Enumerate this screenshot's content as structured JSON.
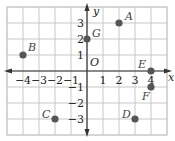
{
  "diagram": {
    "type": "coordinate-plane",
    "x_axis_label": "x",
    "y_axis_label": "y",
    "origin_label": "O",
    "x_range": [
      -4,
      4
    ],
    "y_range": [
      -3,
      3
    ],
    "x_ticks": [
      "-4",
      "-3",
      "-2",
      "-1",
      "1",
      "2",
      "3",
      "4"
    ],
    "y_ticks": [
      "3",
      "2",
      "1",
      "-1",
      "-2",
      "-3"
    ],
    "grid_color": "#c8c8c8",
    "axis_color": "#333333",
    "point_color": "#555555",
    "points": [
      {
        "label": "A",
        "x": 2,
        "y": 3
      },
      {
        "label": "B",
        "x": -4,
        "y": 1
      },
      {
        "label": "C",
        "x": -2,
        "y": -3
      },
      {
        "label": "D",
        "x": 3,
        "y": -3
      },
      {
        "label": "E",
        "x": 4,
        "y": 0
      },
      {
        "label": "F",
        "x": 4,
        "y": -1
      },
      {
        "label": "G",
        "x": 0,
        "y": 2
      }
    ]
  }
}
